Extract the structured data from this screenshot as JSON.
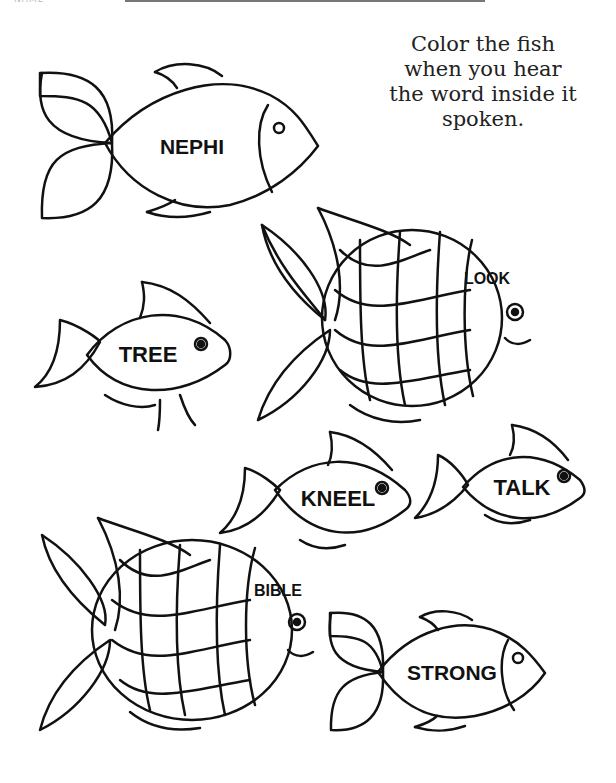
{
  "header": {
    "name_label": "NAME"
  },
  "instructions": [
    "Color the fish",
    "when you hear",
    "the word inside it",
    "spoken."
  ],
  "fish": [
    {
      "word": "NEPHI",
      "style": "simple"
    },
    {
      "word": "LOOK",
      "style": "scaled"
    },
    {
      "word": "TREE",
      "style": "round"
    },
    {
      "word": "KNEEL",
      "style": "round"
    },
    {
      "word": "TALK",
      "style": "round"
    },
    {
      "word": "BIBLE",
      "style": "scaled"
    },
    {
      "word": "STRONG",
      "style": "simple"
    }
  ]
}
